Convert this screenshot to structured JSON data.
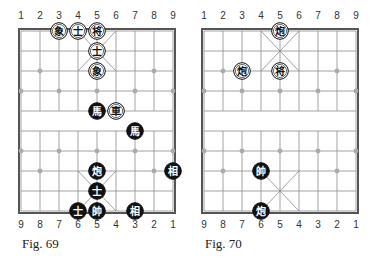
{
  "colors": {
    "line": "#8a8a8a",
    "border": "#555555",
    "black_piece": "#111111",
    "white_piece": "#ffffff",
    "text": "#333333"
  },
  "top_labels": [
    "1",
    "2",
    "3",
    "4",
    "5",
    "6",
    "7",
    "8",
    "9"
  ],
  "bottom_labels": [
    "9",
    "8",
    "7",
    "6",
    "5",
    "4",
    "3",
    "2",
    "1"
  ],
  "diagrams": [
    {
      "id": "fig69",
      "caption": "Fig. 69",
      "pieces": [
        {
          "char": "象",
          "side": "white",
          "file": 3,
          "rank": 0
        },
        {
          "char": "士",
          "side": "white",
          "file": 4,
          "rank": 0
        },
        {
          "char": "将",
          "side": "white",
          "file": 5,
          "rank": 0
        },
        {
          "char": "士",
          "side": "white",
          "file": 5,
          "rank": 1
        },
        {
          "char": "象",
          "side": "white",
          "file": 5,
          "rank": 2
        },
        {
          "char": "馬",
          "side": "black",
          "file": 5,
          "rank": 4
        },
        {
          "char": "車",
          "side": "white",
          "file": 6,
          "rank": 4
        },
        {
          "char": "馬",
          "side": "black",
          "file": 7,
          "rank": 5
        },
        {
          "char": "炮",
          "side": "black",
          "file": 5,
          "rank": 7
        },
        {
          "char": "相",
          "side": "black",
          "file": 9,
          "rank": 7
        },
        {
          "char": "士",
          "side": "black",
          "file": 5,
          "rank": 8
        },
        {
          "char": "士",
          "side": "black",
          "file": 4,
          "rank": 9
        },
        {
          "char": "帥",
          "side": "black",
          "file": 5,
          "rank": 9
        },
        {
          "char": "相",
          "side": "black",
          "file": 7,
          "rank": 9
        }
      ]
    },
    {
      "id": "fig70",
      "caption": "Fig. 70",
      "pieces": [
        {
          "char": "炮",
          "side": "white",
          "file": 5,
          "rank": 0
        },
        {
          "char": "炮",
          "side": "white",
          "file": 3,
          "rank": 2
        },
        {
          "char": "将",
          "side": "white",
          "file": 5,
          "rank": 2
        },
        {
          "char": "帥",
          "side": "black",
          "file": 4,
          "rank": 7
        },
        {
          "char": "炮",
          "side": "black",
          "file": 4,
          "rank": 9
        }
      ]
    }
  ]
}
